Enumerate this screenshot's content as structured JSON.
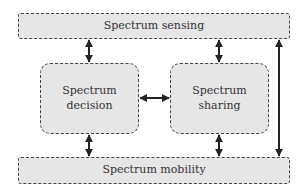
{
  "diagram": {
    "nodes": [
      {
        "id": "sensing",
        "label": "Spectrum sensing"
      },
      {
        "id": "decision",
        "label": "Spectrum\ndecision",
        "line1": "Spectrum",
        "line2": "decision"
      },
      {
        "id": "sharing",
        "label": "Spectrum sharing"
      },
      {
        "id": "mobility",
        "label": "Spectrum mobility"
      }
    ],
    "edges": [
      {
        "from": "sensing",
        "to": "decision",
        "bidirectional": true
      },
      {
        "from": "sensing",
        "to": "sharing",
        "bidirectional": true
      },
      {
        "from": "decision",
        "to": "sharing",
        "bidirectional": true
      },
      {
        "from": "decision",
        "to": "mobility",
        "bidirectional": true
      },
      {
        "from": "sharing",
        "to": "mobility",
        "bidirectional": true
      },
      {
        "from": "sensing",
        "to": "mobility",
        "bidirectional": true
      }
    ],
    "colors": {
      "fill": "#e6e6e6",
      "border": "#444444",
      "arrow": "#222222"
    }
  }
}
